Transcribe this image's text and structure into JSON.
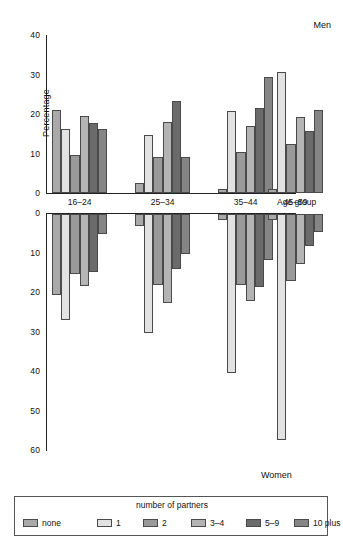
{
  "chart_data": {
    "type": "bar",
    "title": "",
    "subtitle": "",
    "xlabel": "Age group",
    "ylabel": "Percentage",
    "orientation": "vertical",
    "layout": "back-to-back population pyramid (Men above axis, Women below axis)",
    "grid": false,
    "legend_position": "bottom",
    "legend_title": "number of partners",
    "panel_labels": {
      "top": "Men",
      "bottom": "Women"
    },
    "categories": [
      "16–24",
      "25–34",
      "35–44",
      "45–59"
    ],
    "series_names": [
      "none",
      "1",
      "2",
      "3–4",
      "5–9",
      "10 plus"
    ],
    "top_axis": {
      "label": "Men",
      "ticks": [
        0,
        10,
        20,
        30,
        40
      ],
      "ticklabels": [
        "0",
        "10",
        "20",
        "30",
        "40"
      ],
      "ylim": [
        0,
        40
      ]
    },
    "bottom_axis": {
      "label": "Women",
      "ticks": [
        0,
        10,
        20,
        30,
        40,
        50,
        60
      ],
      "ticklabels": [
        "0",
        "10",
        "20",
        "30",
        "40",
        "50",
        "60"
      ],
      "ylim": [
        0,
        60
      ]
    },
    "men": [
      {
        "category": "16–24",
        "values": [
          21.0,
          16.2,
          9.5,
          19.4,
          17.8,
          16.1
        ]
      },
      {
        "category": "25–34",
        "values": [
          2.6,
          14.8,
          9.0,
          18.0,
          23.4,
          9.0
        ]
      },
      {
        "category": "35–44",
        "values": [
          1.1,
          20.8,
          10.4,
          17.0,
          21.4,
          29.4
        ]
      },
      {
        "category": "45–59",
        "values": [
          1.0,
          30.6,
          12.4,
          19.3,
          15.7,
          21.0
        ]
      }
    ],
    "women": [
      {
        "category": "16–24",
        "values": [
          20.4,
          26.9,
          15.2,
          18.2,
          14.6,
          5.1
        ]
      },
      {
        "category": "25–34",
        "values": [
          3.0,
          30.2,
          18.0,
          22.6,
          14.0,
          10.0
        ]
      },
      {
        "category": "35–44",
        "values": [
          1.6,
          40.2,
          18.0,
          22.0,
          18.6,
          11.6
        ]
      },
      {
        "category": "45–59",
        "values": [
          1.5,
          57.2,
          17.0,
          12.6,
          8.2,
          4.6
        ]
      }
    ],
    "colors": {
      "none": "#a9a9a9",
      "1": "#e2e2e2",
      "2": "#9a9a9a",
      "3–4": "#b4b4b4",
      "5–9": "#6b6b6b",
      "10 plus": "#858585",
      "bar_outline": "#4a4a4a",
      "axis": "#222222",
      "background": "#ffffff"
    }
  },
  "legend": {
    "title": "number of partners",
    "items": [
      {
        "label": "none",
        "color": "#a9a9a9"
      },
      {
        "label": "1",
        "color": "#e2e2e2"
      },
      {
        "label": "2",
        "color": "#9a9a9a"
      },
      {
        "label": "3–4",
        "color": "#b4b4b4"
      },
      {
        "label": "5–9",
        "color": "#6b6b6b"
      },
      {
        "label": "10 plus",
        "color": "#858585"
      }
    ]
  }
}
